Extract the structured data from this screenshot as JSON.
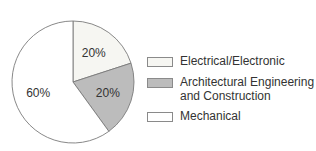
{
  "chart_data": {
    "type": "pie",
    "title": "",
    "categories": [
      "Electrical/Electronic",
      "Architectural Engineering and Construction",
      "Mechanical"
    ],
    "values": [
      20,
      20,
      60
    ],
    "labels": [
      "20%",
      "20%",
      "60%"
    ],
    "colors": [
      "#f6f6f2",
      "#bcbcbc",
      "#ffffff"
    ],
    "legend_position": "right"
  },
  "legend": {
    "items": [
      {
        "label": "Electrical/Electronic",
        "color": "#f6f6f2"
      },
      {
        "label": "Architectural Engineering",
        "label2": "and Construction",
        "color": "#bcbcbc"
      },
      {
        "label": "Mechanical",
        "color": "#ffffff"
      }
    ]
  }
}
